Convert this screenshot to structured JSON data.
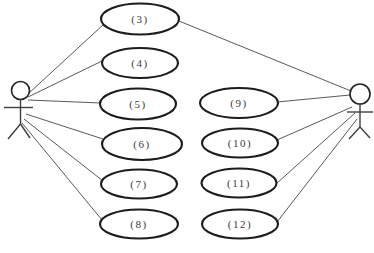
{
  "diagram": {
    "type": "use-case-diagram",
    "background_color": "#ffffff",
    "colors": {
      "ellipse_stroke": "#1c1c1c",
      "association_line": "#5a5a5a",
      "label_text": "#3a3a3a",
      "actor_stroke": "#3f3f3f"
    },
    "actors": [
      {
        "id": "actor-left",
        "side": "left"
      },
      {
        "id": "actor-right",
        "side": "right"
      }
    ],
    "use_cases": [
      {
        "id": "uc-3",
        "label": "(3)",
        "column": "left"
      },
      {
        "id": "uc-4",
        "label": "(4)",
        "column": "left"
      },
      {
        "id": "uc-5",
        "label": "(5)",
        "column": "left"
      },
      {
        "id": "uc-6",
        "label": "(6)",
        "column": "left"
      },
      {
        "id": "uc-7",
        "label": "(7)",
        "column": "left"
      },
      {
        "id": "uc-8",
        "label": "(8)",
        "column": "left"
      },
      {
        "id": "uc-9",
        "label": "(9)",
        "column": "right"
      },
      {
        "id": "uc-10",
        "label": "(10)",
        "column": "right"
      },
      {
        "id": "uc-11",
        "label": "(11)",
        "column": "right"
      },
      {
        "id": "uc-12",
        "label": "(12)",
        "column": "right"
      }
    ],
    "associations": [
      {
        "from": "actor-left",
        "to": "uc-3"
      },
      {
        "from": "actor-left",
        "to": "uc-4"
      },
      {
        "from": "actor-left",
        "to": "uc-5"
      },
      {
        "from": "actor-left",
        "to": "uc-6"
      },
      {
        "from": "actor-left",
        "to": "uc-7"
      },
      {
        "from": "actor-left",
        "to": "uc-8"
      },
      {
        "from": "actor-right",
        "to": "uc-3"
      },
      {
        "from": "actor-right",
        "to": "uc-9"
      },
      {
        "from": "actor-right",
        "to": "uc-10"
      },
      {
        "from": "actor-right",
        "to": "uc-11"
      },
      {
        "from": "actor-right",
        "to": "uc-12"
      }
    ]
  }
}
